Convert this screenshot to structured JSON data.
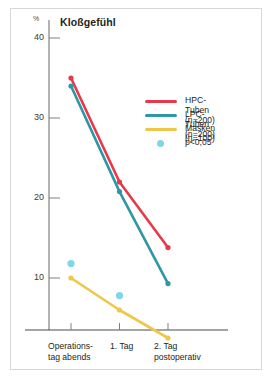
{
  "chart_data": {
    "type": "line",
    "title": "Kloßgefühl",
    "ylabel": "%",
    "xlabel": "",
    "ylim": [
      0,
      42
    ],
    "yticks": [
      10,
      20,
      30,
      40
    ],
    "ytick_labels": [
      "10",
      "20",
      "30",
      "40"
    ],
    "grid": false,
    "legend_position": "center-right",
    "categories": [
      "Operations-\ntag abends",
      "1. Tag",
      "2. Tag\npostoperativ"
    ],
    "xtick_labels": [
      {
        "line1": "Operations-",
        "line2": "tag abends"
      },
      {
        "line1": "1. Tag",
        "line2": ""
      },
      {
        "line1": "2. Tag",
        "line2": "postoperativ"
      }
    ],
    "series": [
      {
        "name": "HPC-Tuben (n=200)",
        "color": "#e8394a",
        "values": [
          35.0,
          22.0,
          13.8
        ]
      },
      {
        "name": "LPC-Tuben (n=200)",
        "color": "#2e96a6",
        "values": [
          34.0,
          20.8,
          9.3
        ]
      },
      {
        "name": "Masken (n=100)",
        "color": "#edc74a",
        "values": [
          10.0,
          6.0,
          2.5
        ]
      }
    ],
    "significance": {
      "label": "p<0,05",
      "color": "#7fd6e8",
      "points": [
        {
          "x_index": 0,
          "value": 11.8
        },
        {
          "x_index": 1,
          "value": 7.8
        }
      ]
    },
    "legend_entries": [
      {
        "label": "HPC-Tuben (n=200)",
        "color": "#e8394a",
        "marker": "line"
      },
      {
        "label": "LPC-Tuben (n=200)",
        "color": "#2e96a6",
        "marker": "line"
      },
      {
        "label": "Masken (n=100)",
        "color": "#edc74a",
        "marker": "line"
      },
      {
        "label": "p<0,05",
        "color": "#7fd6e8",
        "marker": "dot"
      }
    ]
  },
  "axis": {
    "unit_label": "%"
  }
}
